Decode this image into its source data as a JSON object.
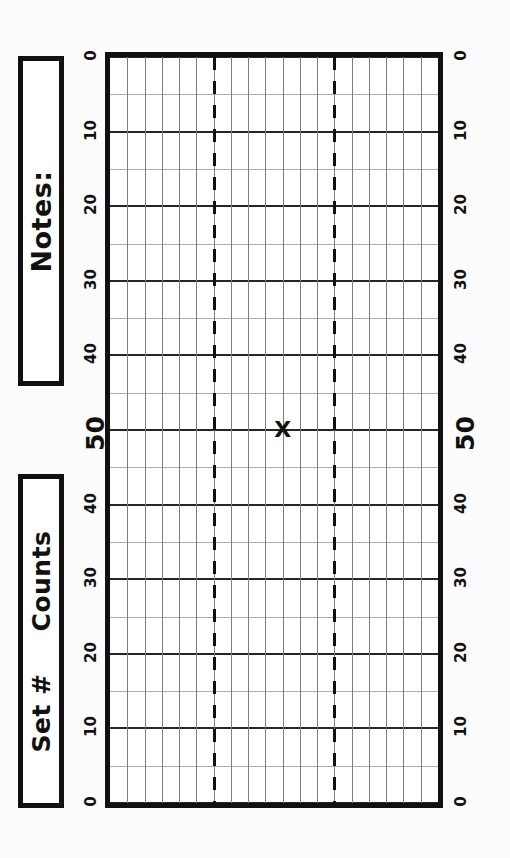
{
  "form": {
    "title": "Counts grid form",
    "notes_box": {
      "label": "Notes:"
    },
    "counts_box": {
      "label_left": "Set #",
      "label_right": "Counts"
    }
  },
  "colors": {
    "ink": "#111111",
    "major_grid": "#262626",
    "minor_grid": "#adadad",
    "vertical_grid": "#7e7e7e",
    "paper": "#ffffff"
  },
  "chart_data": {
    "type": "scatter",
    "title": "Counts",
    "xlabel": "Set #",
    "ylabel": "Counts",
    "orientation": "rotated-90-ccw",
    "grid": true,
    "legend": "none",
    "y_axis": {
      "tick_labels_left": [
        "0",
        "10",
        "20",
        "30",
        "40",
        "50",
        "40",
        "30",
        "20",
        "10",
        "0"
      ],
      "tick_labels_right": [
        "0",
        "10",
        "20",
        "30",
        "40",
        "50",
        "40",
        "30",
        "20",
        "10",
        "0"
      ],
      "emphasized_tick": "50",
      "major_interval": 10,
      "minor_interval": 5,
      "fold_value": 50,
      "ylim": [
        0,
        100
      ]
    },
    "x_axis": {
      "columns": 19,
      "dashed_divider_columns": [
        6,
        13
      ],
      "xlim": [
        0,
        19
      ]
    },
    "points": [
      {
        "label": "X",
        "x": 10.0,
        "y": 50,
        "marker": "x"
      }
    ]
  }
}
